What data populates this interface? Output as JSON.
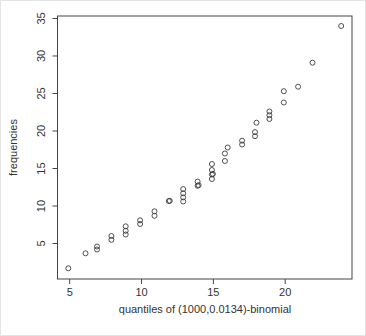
{
  "figure": {
    "background": "#ffffff",
    "axis_color": "#444444",
    "point_color": "#3c3c3c"
  },
  "chart_data": {
    "type": "scatter",
    "title": "",
    "xlabel": "quantiles of (1000,0.0134)-binomial",
    "ylabel": "frequencies",
    "xlim": [
      4.15,
      24.65
    ],
    "ylim": [
      0.27,
      35.33
    ],
    "x_ticks": [
      5,
      10,
      15,
      20
    ],
    "y_ticks": [
      5,
      10,
      15,
      20,
      25,
      30,
      35
    ],
    "grid": false,
    "legend_position": "none",
    "marker": "open-circle",
    "points": [
      [
        4.9,
        1.7
      ],
      [
        6.1,
        3.7
      ],
      [
        6.9,
        4.2
      ],
      [
        6.9,
        4.6
      ],
      [
        7.9,
        5.5
      ],
      [
        7.9,
        6.0
      ],
      [
        8.9,
        6.2
      ],
      [
        8.9,
        6.7
      ],
      [
        8.9,
        7.3
      ],
      [
        9.9,
        7.6
      ],
      [
        9.9,
        8.1
      ],
      [
        10.9,
        8.7
      ],
      [
        10.9,
        9.3
      ],
      [
        11.9,
        10.65
      ],
      [
        11.97,
        10.7
      ],
      [
        12.9,
        10.6
      ],
      [
        12.9,
        11.15
      ],
      [
        12.9,
        11.7
      ],
      [
        12.9,
        12.25
      ],
      [
        13.9,
        12.7
      ],
      [
        13.97,
        12.78
      ],
      [
        13.9,
        13.25
      ],
      [
        14.9,
        13.6
      ],
      [
        14.9,
        14.2
      ],
      [
        14.97,
        14.28
      ],
      [
        14.9,
        14.8
      ],
      [
        14.9,
        15.6
      ],
      [
        15.8,
        16.0
      ],
      [
        15.8,
        17.0
      ],
      [
        16.0,
        17.8
      ],
      [
        17.0,
        18.2
      ],
      [
        17.0,
        18.7
      ],
      [
        17.9,
        19.3
      ],
      [
        17.9,
        19.85
      ],
      [
        18.0,
        21.1
      ],
      [
        18.9,
        21.6
      ],
      [
        18.9,
        22.1
      ],
      [
        18.9,
        22.6
      ],
      [
        19.9,
        23.8
      ],
      [
        19.9,
        25.3
      ],
      [
        20.9,
        25.9
      ],
      [
        21.9,
        29.1
      ],
      [
        23.9,
        34.0
      ]
    ]
  }
}
